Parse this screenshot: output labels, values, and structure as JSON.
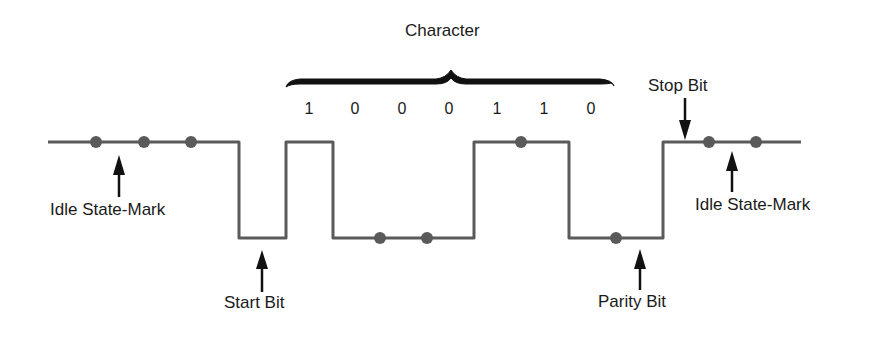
{
  "diagram": {
    "title": "Character",
    "bits": [
      "1",
      "0",
      "0",
      "0",
      "1",
      "1",
      "0"
    ],
    "labels": {
      "idle_left": "Idle State-Mark",
      "start_bit": "Start Bit",
      "parity_bit": "Parity Bit",
      "stop_bit": "Stop Bit",
      "idle_right": "Idle State-Mark"
    },
    "colors": {
      "waveform": "#5a5a5a",
      "dots": "#5a5a5a",
      "arrows": "#111111",
      "brace": "#111111",
      "text": "#1a1a1a"
    },
    "waveform_levels": [
      "mark",
      "space",
      "1",
      "0",
      "0",
      "0",
      "1",
      "1",
      "0",
      "0-parity",
      "stop-mark",
      "mark"
    ]
  }
}
